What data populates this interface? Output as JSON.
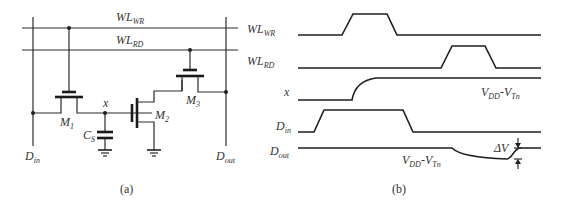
{
  "figure": {
    "panel_a": {
      "caption": "(a)",
      "labels": {
        "wl_wr": {
          "main": "WL",
          "sub": "WR"
        },
        "wl_rd": {
          "main": "WL",
          "sub": "RD"
        },
        "node_x": "x",
        "m1": {
          "main": "M",
          "sub": "1"
        },
        "m2": {
          "main": "M",
          "sub": "2"
        },
        "m3": {
          "main": "M",
          "sub": "3"
        },
        "cs": {
          "main": "C",
          "sub": "S"
        },
        "d_in": {
          "main": "D",
          "sub": "in"
        },
        "d_out": {
          "main": "D",
          "sub": "out"
        }
      }
    },
    "panel_b": {
      "caption": "(b)",
      "signals": [
        {
          "main": "WL",
          "sub": "WR"
        },
        {
          "main": "WL",
          "sub": "RD"
        },
        {
          "main": "x",
          "sub": ""
        },
        {
          "main": "D",
          "sub": "in"
        },
        {
          "main": "D",
          "sub": "out"
        }
      ],
      "annotations": {
        "x_level": {
          "a": "V",
          "a_sub": "DD",
          "dash": "-",
          "b": "V",
          "b_sub": "Tn"
        },
        "dout_level": {
          "a": "V",
          "a_sub": "DD",
          "dash": "-",
          "b": "V",
          "b_sub": "Tn"
        },
        "delta_v": "ΔV"
      }
    },
    "colors": {
      "line": "#2b2b2b",
      "text": "#333333",
      "background": "#ffffff"
    }
  }
}
